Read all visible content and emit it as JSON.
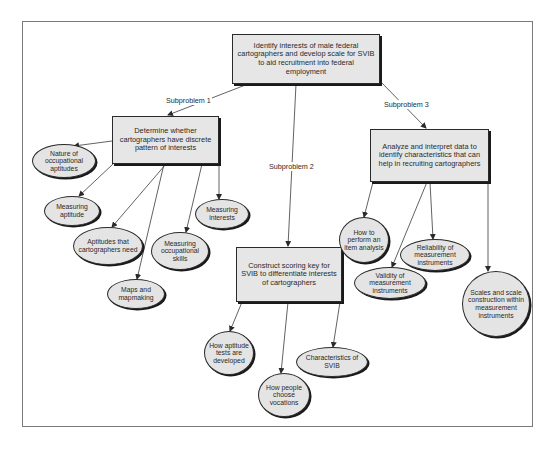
{
  "diagram": {
    "type": "concept map / problem decomposition",
    "root": {
      "id": "root",
      "text": "Identify interests of male federal cartographers and develop scale for SVIB to aid recruitment into federal employment"
    },
    "edge_labels": {
      "sub1": "Subproblem 1",
      "sub2": "Subproblem 2",
      "sub3": "Subproblem 3"
    },
    "subproblems": [
      {
        "id": "sub1",
        "text": "Determine whether cartographers have discrete pattern of interests",
        "topics": [
          "Nature of occupational aptitudes",
          "Measuring aptitude",
          "Aptitudes that cartographers need",
          "Maps and mapmaking",
          "Measuring occupational skills",
          "Measuring interests"
        ]
      },
      {
        "id": "sub2",
        "text": "Construct scoring key for SVIB to differentiate interests of cartographers",
        "topics": [
          "How aptitude tests are developed",
          "How people choose vocations",
          "Characteristics of SVIB"
        ]
      },
      {
        "id": "sub3",
        "text": "Analyze and interpret data to identify characteristics that can help in recruiting cartographers",
        "topics": [
          "How to perform an item analysis",
          "Validity of measurement instruments",
          "Reliability of measurement instruments",
          "Scales and scale construction within measurement instruments"
        ]
      }
    ],
    "colors": {
      "node_fill": "#e6e6e6",
      "node_border": "#2a2a2a",
      "line": "#3a3a3a",
      "frame": "#7a7a7a",
      "background": "#ffffff"
    }
  }
}
